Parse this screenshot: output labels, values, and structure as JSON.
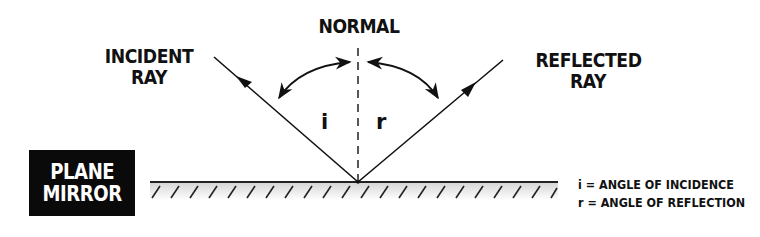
{
  "diagram": {
    "type": "reflection-of-light",
    "labels": {
      "normal": "NORMAL",
      "incident_line1": "INCIDENT",
      "incident_line2": "RAY",
      "reflected_line1": "REFLECTED",
      "reflected_line2": "RAY",
      "mirror_line1": "PLANE",
      "mirror_line2": "MIRROR",
      "angle_i": "i",
      "angle_r": "r"
    },
    "legend": [
      {
        "symbol": "i",
        "text": "i = ANGLE OF INCIDENCE"
      },
      {
        "symbol": "r",
        "text": "r = ANGLE OF REFLECTION"
      }
    ],
    "colors": {
      "ink": "#111111",
      "mirror_box": "#0a0a0a",
      "mirror_shade": "#d9d9d9",
      "background": "#ffffff"
    }
  }
}
